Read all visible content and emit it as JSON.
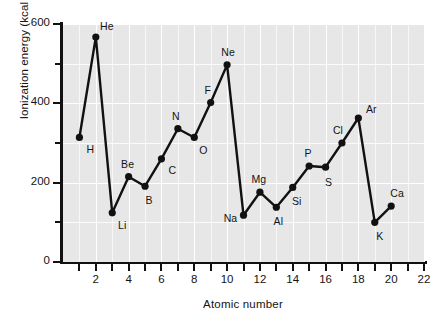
{
  "chart_data": {
    "type": "line",
    "title": "",
    "xlabel": "Atomic number",
    "ylabel": "Ionization energy (kcal / mole)",
    "xlim": [
      0,
      22
    ],
    "ylim": [
      0,
      600
    ],
    "xticks": [
      1,
      2,
      3,
      4,
      5,
      6,
      7,
      8,
      9,
      10,
      11,
      12,
      13,
      14,
      15,
      16,
      17,
      18,
      19,
      20,
      21,
      22
    ],
    "xtick_labels": [
      "",
      "2",
      "",
      "4",
      "",
      "6",
      "",
      "8",
      "",
      "10",
      "",
      "12",
      "",
      "14",
      "",
      "16",
      "",
      "18",
      "",
      "20",
      "",
      "22"
    ],
    "yticks": [
      0,
      100,
      200,
      300,
      400,
      500,
      600
    ],
    "ytick_labels": [
      "0",
      "",
      "200",
      "",
      "400",
      "",
      "600"
    ],
    "grid": true,
    "legend": "none",
    "marker": "filled-circle",
    "line_color": "#111111",
    "plot_background": "#e7e7e7",
    "x": [
      1,
      2,
      3,
      4,
      5,
      6,
      7,
      8,
      9,
      10,
      11,
      12,
      13,
      14,
      15,
      16,
      17,
      18,
      19,
      20
    ],
    "values": [
      314,
      567,
      124,
      215,
      191,
      260,
      336,
      314,
      402,
      497,
      118,
      176,
      138,
      188,
      242,
      239,
      300,
      363,
      100,
      141
    ],
    "point_labels": [
      "H",
      "He",
      "Li",
      "Be",
      "B",
      "C",
      "N",
      "O",
      "F",
      "Ne",
      "Na",
      "Mg",
      "Al",
      "Si",
      "P",
      "S",
      "Cl",
      "Ar",
      "K",
      "Ca"
    ],
    "label_offsets": [
      {
        "dx": 11,
        "dy": 12
      },
      {
        "dx": 11,
        "dy": -11
      },
      {
        "dx": 10,
        "dy": 12
      },
      {
        "dx": -1,
        "dy": -13
      },
      {
        "dx": 4,
        "dy": 14
      },
      {
        "dx": 11,
        "dy": 11
      },
      {
        "dx": -2,
        "dy": -13
      },
      {
        "dx": 9,
        "dy": 13
      },
      {
        "dx": -3,
        "dy": -13
      },
      {
        "dx": 1,
        "dy": -13
      },
      {
        "dx": -13,
        "dy": 3
      },
      {
        "dx": -1,
        "dy": -13
      },
      {
        "dx": 2,
        "dy": 14
      },
      {
        "dx": 4,
        "dy": 14
      },
      {
        "dx": -1,
        "dy": -13
      },
      {
        "dx": 3,
        "dy": 15
      },
      {
        "dx": -4,
        "dy": -13
      },
      {
        "dx": 13,
        "dy": -9
      },
      {
        "dx": 5,
        "dy": 14
      },
      {
        "dx": 6,
        "dy": -13
      }
    ]
  }
}
